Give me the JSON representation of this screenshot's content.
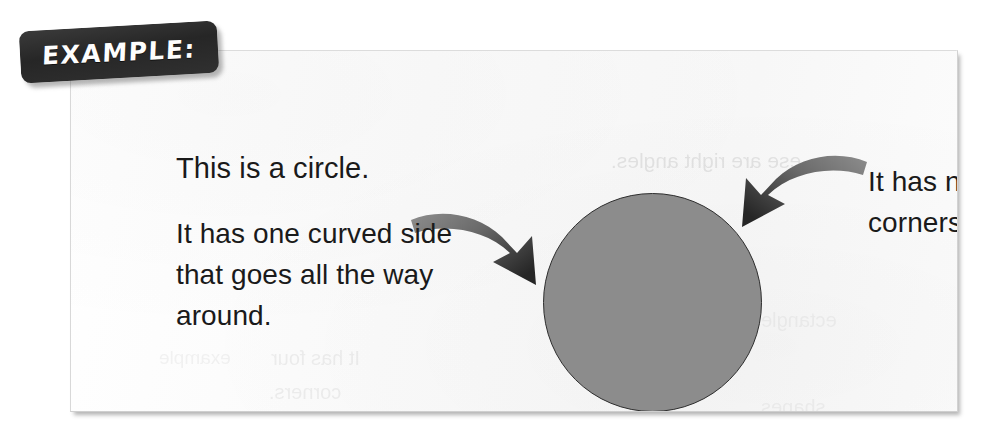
{
  "page": {
    "background_color": "#ffffff",
    "card_background_color": "#fbfbfb",
    "shape_fill_color": "#8c8c8c",
    "shape_outline_color": "#2e2e2e",
    "badge_background_color": "#2b2b2b",
    "badge_text_color": "#fdfdfd",
    "body_text_color": "#1a1a1a"
  },
  "badge": {
    "label": "EXAMPLE:"
  },
  "content": {
    "headline": "This is a circle.",
    "left_caption": "It has one curved side that goes all the way around.",
    "right_caption": "It has no corners."
  },
  "shape": {
    "name": "circle",
    "center_x": 582,
    "center_y": 252,
    "radius": 110
  },
  "arrows": [
    {
      "name": "left-curved-arrow",
      "points_to": "circle",
      "direction": "down-right"
    },
    {
      "name": "right-curved-arrow",
      "points_to": "circle",
      "direction": "down-left"
    }
  ],
  "bleed_through": {
    "note": "faint mirrored show-through text from the reverse side of the page",
    "lines": [
      "ese are right angles.",
      "It has four",
      "corners.",
      "ectangle",
      "shapes",
      "example"
    ]
  }
}
